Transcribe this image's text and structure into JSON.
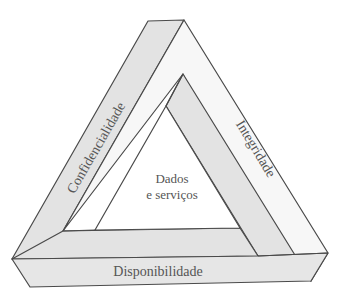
{
  "diagram": {
    "type": "impossible-triangle",
    "center_label_line1": "Dados",
    "center_label_line2": "e serviços",
    "sides": {
      "left": "Confidencialidade",
      "right": "Integridade",
      "bottom": "Disponibilidade"
    },
    "colors": {
      "band_gray": "#e3e3e3",
      "band_light": "#f7f7f7",
      "stroke": "#4a4a4a",
      "text": "#555555",
      "background": "#ffffff"
    }
  }
}
